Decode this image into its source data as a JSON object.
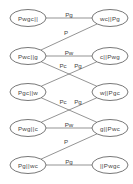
{
  "diagram": {
    "nodes": [
      {
        "id": "n0",
        "label": "Pwgc||",
        "x": 28,
        "y": 18
      },
      {
        "id": "n1",
        "label": "wc||Pg",
        "x": 110,
        "y": 18
      },
      {
        "id": "n2",
        "label": "Pwc||g",
        "x": 28,
        "y": 56
      },
      {
        "id": "n3",
        "label": "c||Pwg",
        "x": 110,
        "y": 56
      },
      {
        "id": "n4",
        "label": "Pgc||w",
        "x": 28,
        "y": 92
      },
      {
        "id": "n5",
        "label": "w||Pgc",
        "x": 110,
        "y": 92
      },
      {
        "id": "n6",
        "label": "Pwg||c",
        "x": 28,
        "y": 128
      },
      {
        "id": "n7",
        "label": "g||Pwc",
        "x": 110,
        "y": 128
      },
      {
        "id": "n8",
        "label": "Pg||wc",
        "x": 28,
        "y": 165
      },
      {
        "id": "n9",
        "label": "||Pwgc",
        "x": 110,
        "y": 165
      }
    ],
    "edges": [
      {
        "from": "n0",
        "to": "n1",
        "label": "Pg",
        "lx": 69,
        "ly": 14
      },
      {
        "from": "n1",
        "to": "n2",
        "label": "P",
        "lx": 66,
        "ly": 32
      },
      {
        "from": "n2",
        "to": "n3",
        "label": "Pw",
        "lx": 69,
        "ly": 52
      },
      {
        "from": "n2",
        "to": "n5",
        "label": "Pc",
        "lx": 63,
        "ly": 65
      },
      {
        "from": "n3",
        "to": "n4",
        "label": "Pg",
        "lx": 78,
        "ly": 65
      },
      {
        "from": "n4",
        "to": "n7",
        "label": "Pc",
        "lx": 63,
        "ly": 101
      },
      {
        "from": "n5",
        "to": "n6",
        "label": "Pg",
        "lx": 78,
        "ly": 101
      },
      {
        "from": "n6",
        "to": "n7",
        "label": "Pw",
        "lx": 69,
        "ly": 124
      },
      {
        "from": "n7",
        "to": "n8",
        "label": "P",
        "lx": 66,
        "ly": 141
      },
      {
        "from": "n8",
        "to": "n9",
        "label": "Pg",
        "lx": 69,
        "ly": 161
      }
    ]
  }
}
